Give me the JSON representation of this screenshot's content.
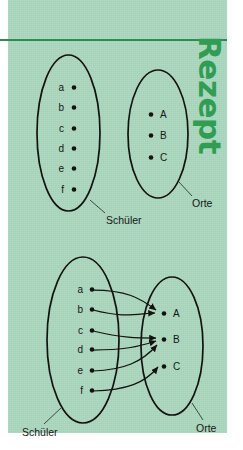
{
  "page": {
    "background_color": "#a8d6bb",
    "margin_color": "#ffffff",
    "rule_color": "#2c8f51",
    "ink_color": "#14120f"
  },
  "side_heading": {
    "text": "Rezept",
    "color": "#2e9e52",
    "orientation": "vertical-rotated-90"
  },
  "diagrams": [
    {
      "id": "upper",
      "title_left": "Schüler",
      "title_right": "Orte",
      "left_set": {
        "label": "Schüler",
        "elements": [
          "a",
          "b",
          "c",
          "d",
          "e",
          "f"
        ]
      },
      "right_set": {
        "label": "Orte",
        "elements": [
          "A",
          "B",
          "C"
        ]
      },
      "arrows": []
    },
    {
      "id": "lower",
      "title_left": "Schüler",
      "title_right": "Orte",
      "left_set": {
        "label": "Schüler",
        "elements": [
          "a",
          "b",
          "c",
          "d",
          "e",
          "f"
        ]
      },
      "right_set": {
        "label": "Orte",
        "elements": [
          "A",
          "B",
          "C"
        ]
      },
      "arrows": [
        {
          "from": "a",
          "to": "A"
        },
        {
          "from": "b",
          "to": "A"
        },
        {
          "from": "c",
          "to": "B"
        },
        {
          "from": "d",
          "to": "B"
        },
        {
          "from": "e",
          "to": "B"
        },
        {
          "from": "f",
          "to": "C"
        }
      ]
    }
  ],
  "labels": {
    "schueler": "Schüler",
    "orte": "Orte",
    "a": "a",
    "b": "b",
    "c": "c",
    "d": "d",
    "e": "e",
    "f": "f",
    "A": "A",
    "B": "B",
    "C": "C"
  }
}
